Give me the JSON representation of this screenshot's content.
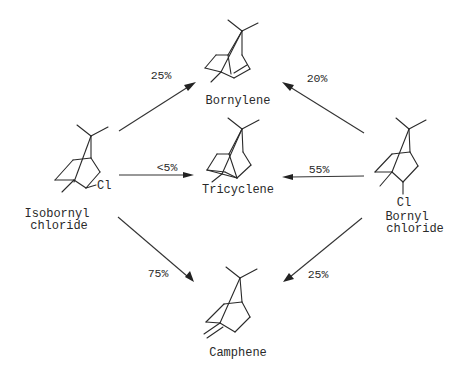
{
  "diagram": {
    "type": "reaction-scheme",
    "colors": {
      "ink": "#2a2a2a",
      "background": "#ffffff"
    },
    "compounds": {
      "isobornyl_chloride": {
        "name_line1": "Isobornyl",
        "name_line2": "chloride",
        "substituent": "Cl"
      },
      "bornyl_chloride": {
        "name_line1": "Bornyl",
        "name_line2": "chloride",
        "substituent": "Cl"
      },
      "bornylene": {
        "name": "Bornylene"
      },
      "tricyclene": {
        "name": "Tricyclene"
      },
      "camphene": {
        "name": "Camphene"
      }
    },
    "arrows": [
      {
        "from": "Isobornyl chloride",
        "to": "Bornylene",
        "label": "25%"
      },
      {
        "from": "Isobornyl chloride",
        "to": "Tricyclene",
        "label": "<5%"
      },
      {
        "from": "Isobornyl chloride",
        "to": "Camphene",
        "label": "75%"
      },
      {
        "from": "Bornyl chloride",
        "to": "Bornylene",
        "label": "20%"
      },
      {
        "from": "Bornyl chloride",
        "to": "Tricyclene",
        "label": "55%"
      },
      {
        "from": "Bornyl chloride",
        "to": "Camphene",
        "label": "25%"
      }
    ]
  }
}
